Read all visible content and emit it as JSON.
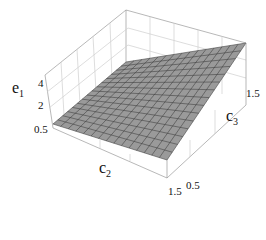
{
  "chart_data": {
    "type": "surface3d",
    "title": "",
    "xlabel": "c2",
    "ylabel": "c3",
    "zlabel": "e1",
    "x_axis": {
      "name": "c2",
      "range": [
        0.5,
        1.5
      ],
      "ticks": [
        "0.5",
        "1.5"
      ]
    },
    "y_axis": {
      "name": "c3",
      "range": [
        0.5,
        1.5
      ],
      "ticks": [
        "0.5",
        "1.5"
      ]
    },
    "z_axis": {
      "name": "e1",
      "ticks": [
        "2",
        "4"
      ],
      "range": [
        1,
        5
      ]
    },
    "surface": {
      "description": "planar surface increasing with c2 and c3",
      "grid_lines": 15,
      "corner_values": [
        {
          "c2": 0.5,
          "c3": 0.5,
          "e1": 1.5
        },
        {
          "c2": 1.5,
          "c3": 0.5,
          "e1": 1.5
        },
        {
          "c2": 0.5,
          "c3": 1.5,
          "e1": 4.0
        },
        {
          "c2": 1.5,
          "c3": 1.5,
          "e1": 3.5
        }
      ]
    },
    "style": {
      "surface_fill": "#9a9a9a",
      "mesh_color": "#333333",
      "box_color": "#888888",
      "boxed": true
    }
  },
  "labels": {
    "z_title": "e",
    "z_sub": "1",
    "x_title": "c",
    "x_sub": "2",
    "y_title": "c",
    "y_sub": "3",
    "z_tick_4": "4",
    "z_tick_2": "2",
    "z_tick_05": "0.5",
    "y_tick_15": "1.5",
    "x_tick_15": "1.5",
    "y_tick_05": "0.5"
  }
}
